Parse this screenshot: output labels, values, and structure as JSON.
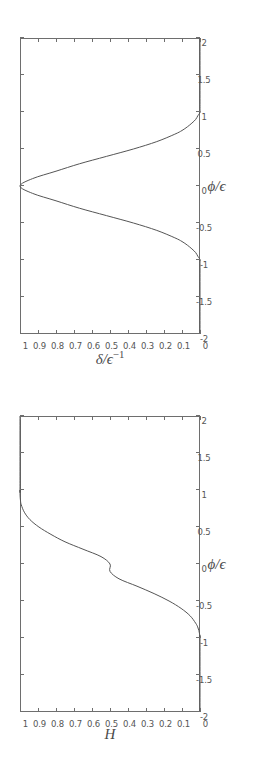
{
  "figure": {
    "orientation": "rotated-90-ccw",
    "background": "#ffffff",
    "ink": "#555555"
  },
  "chart_data": [
    {
      "id": "delta-plot",
      "type": "line",
      "title": "",
      "xlabel": "ϕ/ϵ",
      "ylabel": "δ/ϵ−1",
      "ylabel_base": "δ/ϵ",
      "ylabel_exp": "−1",
      "xlim": [
        -2,
        2
      ],
      "ylim": [
        0,
        1
      ],
      "grid": false,
      "legend": "none",
      "xticks": [
        -2,
        -1.5,
        -1,
        -0.5,
        0,
        0.5,
        1,
        1.5,
        2
      ],
      "xticklabels": [
        "-2",
        "-1.5",
        "-1",
        "-0.5",
        "0",
        "0.5",
        "1",
        "1.5",
        "2"
      ],
      "yticks": [
        0,
        0.1,
        0.2,
        0.3,
        0.4,
        0.5,
        0.6,
        0.7,
        0.8,
        0.9,
        1
      ],
      "yticklabels": [
        "0",
        "0.1",
        "0.2",
        "0.3",
        "0.4",
        "0.5",
        "0.6",
        "0.7",
        "0.8",
        "0.9",
        "1"
      ],
      "description": "Symmetric bell-shaped pulse, zero outside |x|>1, peak value 1 at x=0",
      "x": [
        -2.0,
        -1.1,
        -1.0,
        -0.95,
        -0.9,
        -0.85,
        -0.8,
        -0.75,
        -0.7,
        -0.6,
        -0.5,
        -0.4,
        -0.3,
        -0.2,
        -0.1,
        0.0,
        0.1,
        0.2,
        0.3,
        0.4,
        0.5,
        0.6,
        0.7,
        0.75,
        0.8,
        0.85,
        0.9,
        0.95,
        1.0,
        1.1,
        2.0
      ],
      "y": [
        0.0,
        0.0,
        0.0,
        0.012,
        0.024,
        0.045,
        0.07,
        0.1,
        0.14,
        0.24,
        0.37,
        0.52,
        0.67,
        0.8,
        0.93,
        1.0,
        0.93,
        0.8,
        0.67,
        0.52,
        0.37,
        0.24,
        0.14,
        0.1,
        0.07,
        0.045,
        0.024,
        0.012,
        0.0,
        0.0,
        0.0
      ]
    },
    {
      "id": "H-plot",
      "type": "line",
      "title": "",
      "xlabel": "ϕ/ϵ",
      "ylabel": "H",
      "xlim": [
        -2,
        2
      ],
      "ylim": [
        0,
        1
      ],
      "grid": false,
      "legend": "none",
      "xticks": [
        -2,
        -1.5,
        -1,
        -0.5,
        0,
        0.5,
        1,
        1.5,
        2
      ],
      "xticklabels": [
        "-2",
        "-1.5",
        "-1",
        "-0.5",
        "0",
        "0.5",
        "1",
        "1.5",
        "2"
      ],
      "yticks": [
        0,
        0.1,
        0.2,
        0.3,
        0.4,
        0.5,
        0.6,
        0.7,
        0.8,
        0.9,
        1
      ],
      "yticklabels": [
        "0",
        "0.1",
        "0.2",
        "0.3",
        "0.4",
        "0.5",
        "0.6",
        "0.7",
        "0.8",
        "0.9",
        "1"
      ],
      "description": "Smoothed Heaviside step: 0 for x<-1, rises monotonically through 0.5 at x=0, saturates at 1 for x>1",
      "x": [
        -2.0,
        -1.05,
        -1.0,
        -0.95,
        -0.9,
        -0.85,
        -0.8,
        -0.7,
        -0.6,
        -0.5,
        -0.4,
        -0.3,
        -0.2,
        -0.1,
        0.0,
        0.1,
        0.2,
        0.3,
        0.4,
        0.5,
        0.6,
        0.7,
        0.8,
        0.85,
        0.9,
        0.95,
        1.0,
        1.05,
        2.0
      ],
      "y": [
        0.0,
        0.0,
        0.0,
        0.002,
        0.006,
        0.013,
        0.024,
        0.055,
        0.105,
        0.172,
        0.255,
        0.35,
        0.45,
        0.5,
        0.5,
        0.55,
        0.65,
        0.75,
        0.828,
        0.895,
        0.945,
        0.976,
        0.993,
        0.997,
        0.999,
        1.0,
        1.0,
        1.0,
        1.0
      ]
    }
  ]
}
